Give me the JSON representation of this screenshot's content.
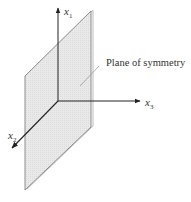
{
  "figure": {
    "type": "3d-coordinate-diagram",
    "plane": {
      "label": "Plane of symmetry",
      "fill_color": "#e6e6e6",
      "edge_color": "#8c8c8c",
      "corners": [
        [
          91,
          11
        ],
        [
          91,
          127
        ],
        [
          25,
          190
        ],
        [
          25,
          76
        ]
      ]
    },
    "axes": [
      {
        "name": "x1",
        "var": "x",
        "sub": "1",
        "direction": "up"
      },
      {
        "name": "x2",
        "var": "x",
        "sub": "2",
        "direction": "down-left (toward viewer)"
      },
      {
        "name": "x3",
        "var": "x",
        "sub": "3",
        "direction": "right"
      }
    ],
    "origin": [
      58,
      101
    ],
    "axis_color": "#333333"
  }
}
